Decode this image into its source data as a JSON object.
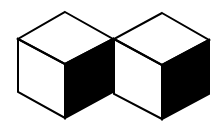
{
  "diagram": {
    "stroke_color": "#000000",
    "background": "#ffffff",
    "cubes": [
      {
        "name": "left-cube",
        "faces": {
          "top": {
            "fill": "#ffffff",
            "points": "65,12 113,39 65,64 18,39"
          },
          "left": {
            "fill": "#ffffff",
            "points": "18,39 65,64 65,118 18,92"
          },
          "right": {
            "fill": "#000000",
            "points": "65,64 113,39 113,92 65,118"
          }
        }
      },
      {
        "name": "right-cube",
        "faces": {
          "top": {
            "fill": "#ffffff",
            "points": "162,13 209,40 162,65 114,39"
          },
          "left": {
            "fill": "#ffffff",
            "points": "114,39 162,65 162,119 114,94"
          },
          "right": {
            "fill": "#000000",
            "points": "162,65 209,40 209,94 162,119"
          }
        }
      }
    ]
  }
}
